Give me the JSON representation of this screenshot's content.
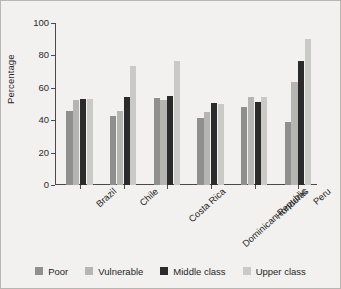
{
  "chart_data": {
    "type": "bar",
    "title": "",
    "xlabel": "",
    "ylabel": "Percentage",
    "ylim": [
      0,
      100
    ],
    "yticks": [
      0,
      20,
      40,
      60,
      80,
      100
    ],
    "grid": false,
    "legend_position": "bottom",
    "categories": [
      "Brazil",
      "Chile",
      "Costa Rica",
      "Dominican Republic",
      "Honduras",
      "Peru"
    ],
    "series": [
      {
        "name": "Poor",
        "color": "#8f8f8d",
        "values": [
          45.5,
          42.3,
          53.5,
          41.2,
          48.3,
          38.6
        ]
      },
      {
        "name": "Vulnerable",
        "color": "#b5b5b2",
        "values": [
          52.3,
          45.5,
          52.6,
          45.3,
          54.3,
          63.4
        ]
      },
      {
        "name": "Middle class",
        "color": "#2b2b2b",
        "values": [
          53.4,
          54.5,
          55.2,
          50.4,
          51.5,
          76.8
        ]
      },
      {
        "name": "Upper class",
        "color": "#c9c9c6",
        "values": [
          53.2,
          73.3,
          76.4,
          49.8,
          54.6,
          90.3
        ]
      }
    ]
  },
  "colors": {
    "figure_background": "#f2f1ef",
    "figure_border": "#b8b6b2",
    "axis": "#4a4a4a",
    "text": "#1f1f1f"
  }
}
